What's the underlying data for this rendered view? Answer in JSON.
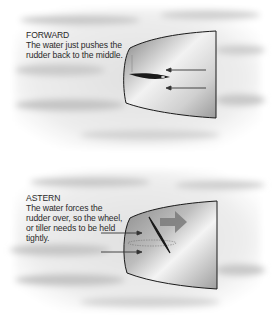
{
  "panels": [
    {
      "id": "forward",
      "title": "FORWARD",
      "text": "The water just pushes the rudder back to the middle."
    },
    {
      "id": "astern",
      "title": "ASTERN",
      "text": "The water forces the rudder over, so the wheel, or tiller needs to be held tightly."
    }
  ],
  "colors": {
    "water": "#d9d9d9",
    "hull_dark": "#8a8a8a",
    "hull_light": "#f4f4f4",
    "outline": "#1a1a1a",
    "arrow": "#333333",
    "thrust_arrow": "#7a7a7a"
  }
}
